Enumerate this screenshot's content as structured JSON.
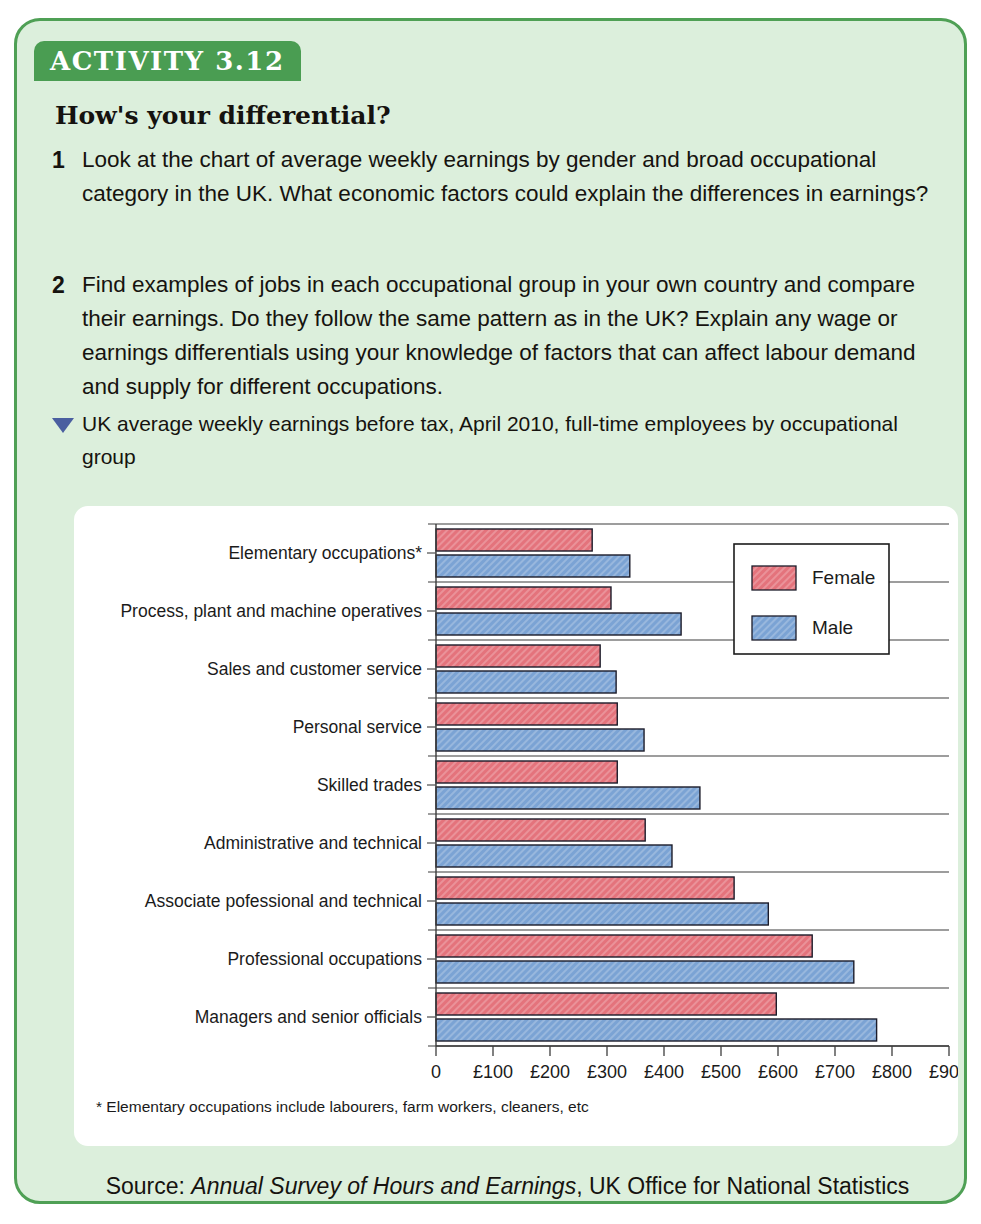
{
  "activity": {
    "tab_label": "ACTIVITY 3.12",
    "heading": "How's your differential?",
    "tasks": [
      {
        "number": "1",
        "text": "Look at the chart of average weekly earnings by gender and broad occupational category in the UK. What economic factors could explain the differences in earnings?"
      },
      {
        "number": "2",
        "text": "Find examples of jobs in each occupational group in your own country and compare their earnings.  Do they follow the same pattern as in the UK? Explain any wage or earnings differentials using your knowledge of factors that can affect labour demand and supply for different occupations."
      }
    ],
    "figure_caption": "UK average weekly earnings before tax, April 2010, full-time employees by occupational group",
    "footnote": "* Elementary occupations include labourers, farm workers, cleaners, etc",
    "source_prefix": "Source: ",
    "source_italic": "Annual Survey of Hours and Earnings",
    "source_suffix": ", UK Office for National Statistics"
  },
  "colors": {
    "panel_bg": "#dcefdc",
    "panel_border": "#4fa055",
    "tab_bg": "#4a9d52",
    "female": "#e4737c",
    "male": "#7ba3d4",
    "bar_outline": "#1c1c2a",
    "triangle": "#4a5fa0"
  },
  "chart_data": {
    "type": "bar",
    "orientation": "horizontal",
    "title": "UK average weekly earnings before tax, April 2010, full-time employees by occupational group",
    "xlabel": "",
    "ylabel": "",
    "xlim": [
      0,
      900
    ],
    "xticks": [
      0,
      100,
      200,
      300,
      400,
      500,
      600,
      700,
      800,
      900
    ],
    "xtick_labels": [
      "0",
      "£100",
      "£200",
      "£300",
      "£400",
      "£500",
      "£600",
      "£700",
      "£800",
      "£900"
    ],
    "grid": true,
    "legend_position": "upper right",
    "categories": [
      "Elementary occupations*",
      "Process, plant and machine operatives",
      "Sales and customer service",
      "Personal service",
      "Skilled trades",
      "Administrative and technical",
      "Associate pofessional and technical",
      "Professional occupations",
      "Managers and senior officials"
    ],
    "series": [
      {
        "name": "Female",
        "color": "#e4737c",
        "values": [
          274,
          307,
          288,
          318,
          318,
          367,
          523,
          660,
          597
        ]
      },
      {
        "name": "Male",
        "color": "#7ba3d4",
        "values": [
          340,
          430,
          316,
          365,
          463,
          414,
          583,
          733,
          773
        ]
      }
    ]
  }
}
